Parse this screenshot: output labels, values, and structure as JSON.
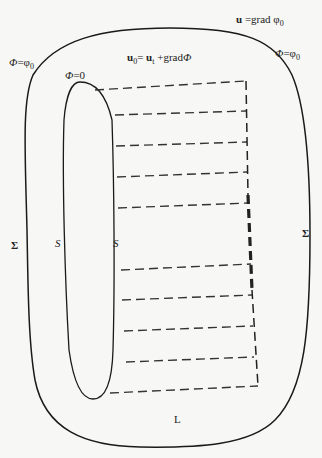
{
  "labels": {
    "top_right_bold": "u",
    "top_right_rest": " =grad φ",
    "top_right_sub": "0",
    "center_bold1": "u",
    "center_sub1": "0",
    "center_mid": "= ",
    "center_bold2": "u",
    "center_sub2": "t",
    "center_rest": " +grad",
    "center_phi": "Φ",
    "left_phi": "Φ",
    "left_eq": "=φ",
    "left_sub": "0",
    "right_phi": "Φ",
    "right_eq": "=φ",
    "right_sub": "0",
    "inner_phi": "Φ",
    "inner_eq": "=0",
    "sigma_left": "Σ",
    "sigma_right": "Σ",
    "s_left": "S",
    "s_right": "S",
    "bottom_L": "L"
  },
  "colors": {
    "stroke": "#1a1a1a",
    "dash": "#333333",
    "background": "#f7f7f5"
  },
  "dashed_lines": [
    {
      "x1": 95,
      "y1": 90,
      "x2": 246,
      "y2": 81
    },
    {
      "x1": 115,
      "y1": 115,
      "x2": 246,
      "y2": 111
    },
    {
      "x1": 116,
      "y1": 146,
      "x2": 247,
      "y2": 142
    },
    {
      "x1": 117,
      "y1": 177,
      "x2": 247,
      "y2": 172
    },
    {
      "x1": 118,
      "y1": 208,
      "x2": 248,
      "y2": 203
    },
    {
      "x1": 121,
      "y1": 270,
      "x2": 251,
      "y2": 264
    },
    {
      "x1": 122,
      "y1": 300,
      "x2": 252,
      "y2": 295
    },
    {
      "x1": 124,
      "y1": 331,
      "x2": 253,
      "y2": 326
    },
    {
      "x1": 126,
      "y1": 362,
      "x2": 254,
      "y2": 357
    },
    {
      "x1": 110,
      "y1": 393,
      "x2": 258,
      "y2": 386
    }
  ]
}
